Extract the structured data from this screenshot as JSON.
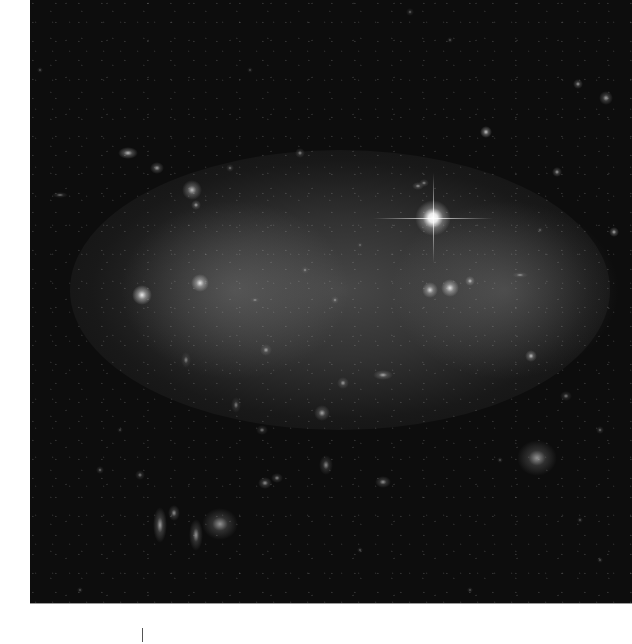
{
  "image": {
    "subject": "galaxy-cluster-deep-field",
    "background_color": "#0d0d0d",
    "border_color": "#ffffff"
  },
  "bright_star": {
    "x": 433,
    "y": 218,
    "size": 12,
    "spike_length_h": 120,
    "spike_length_v": 90
  },
  "objects": [
    {
      "x": 142,
      "y": 295,
      "w": 10,
      "h": 10,
      "b": 0.9
    },
    {
      "x": 200,
      "y": 283,
      "w": 9,
      "h": 9,
      "b": 0.85
    },
    {
      "x": 430,
      "y": 290,
      "w": 8,
      "h": 8,
      "b": 0.8
    },
    {
      "x": 450,
      "y": 288,
      "w": 9,
      "h": 9,
      "b": 0.85
    },
    {
      "x": 470,
      "y": 281,
      "w": 5,
      "h": 5,
      "b": 0.7
    },
    {
      "x": 192,
      "y": 190,
      "w": 10,
      "h": 10,
      "b": 0.7
    },
    {
      "x": 128,
      "y": 153,
      "w": 10,
      "h": 6,
      "b": 0.7
    },
    {
      "x": 157,
      "y": 168,
      "w": 7,
      "h": 6,
      "b": 0.6
    },
    {
      "x": 196,
      "y": 205,
      "w": 5,
      "h": 5,
      "b": 0.6
    },
    {
      "x": 537,
      "y": 458,
      "w": 20,
      "h": 18,
      "b": 0.55
    },
    {
      "x": 220,
      "y": 524,
      "w": 18,
      "h": 16,
      "b": 0.55
    },
    {
      "x": 160,
      "y": 525,
      "w": 7,
      "h": 18,
      "b": 0.6
    },
    {
      "x": 196,
      "y": 535,
      "w": 7,
      "h": 16,
      "b": 0.55
    },
    {
      "x": 174,
      "y": 513,
      "w": 6,
      "h": 8,
      "b": 0.55
    },
    {
      "x": 265,
      "y": 483,
      "w": 7,
      "h": 6,
      "b": 0.55
    },
    {
      "x": 277,
      "y": 478,
      "w": 6,
      "h": 5,
      "b": 0.5
    },
    {
      "x": 383,
      "y": 482,
      "w": 8,
      "h": 6,
      "b": 0.55
    },
    {
      "x": 326,
      "y": 465,
      "w": 7,
      "h": 10,
      "b": 0.5
    },
    {
      "x": 322,
      "y": 413,
      "w": 8,
      "h": 8,
      "b": 0.6
    },
    {
      "x": 383,
      "y": 375,
      "w": 10,
      "h": 5,
      "b": 0.6
    },
    {
      "x": 266,
      "y": 350,
      "w": 6,
      "h": 6,
      "b": 0.55
    },
    {
      "x": 343,
      "y": 383,
      "w": 6,
      "h": 6,
      "b": 0.55
    },
    {
      "x": 531,
      "y": 356,
      "w": 6,
      "h": 6,
      "b": 0.7
    },
    {
      "x": 486,
      "y": 132,
      "w": 6,
      "h": 6,
      "b": 0.75
    },
    {
      "x": 557,
      "y": 172,
      "w": 5,
      "h": 5,
      "b": 0.6
    },
    {
      "x": 606,
      "y": 98,
      "w": 7,
      "h": 7,
      "b": 0.6
    },
    {
      "x": 578,
      "y": 84,
      "w": 5,
      "h": 5,
      "b": 0.6
    },
    {
      "x": 614,
      "y": 232,
      "w": 5,
      "h": 5,
      "b": 0.65
    },
    {
      "x": 418,
      "y": 186,
      "w": 6,
      "h": 4,
      "b": 0.55
    },
    {
      "x": 424,
      "y": 183,
      "w": 5,
      "h": 4,
      "b": 0.5
    },
    {
      "x": 520,
      "y": 275,
      "w": 8,
      "h": 3,
      "b": 0.5
    },
    {
      "x": 262,
      "y": 430,
      "w": 6,
      "h": 5,
      "b": 0.45
    },
    {
      "x": 236,
      "y": 405,
      "w": 5,
      "h": 8,
      "b": 0.45
    },
    {
      "x": 186,
      "y": 360,
      "w": 5,
      "h": 8,
      "b": 0.45
    },
    {
      "x": 300,
      "y": 153,
      "w": 5,
      "h": 5,
      "b": 0.5
    },
    {
      "x": 230,
      "y": 168,
      "w": 4,
      "h": 4,
      "b": 0.45
    },
    {
      "x": 100,
      "y": 470,
      "w": 4,
      "h": 4,
      "b": 0.45
    },
    {
      "x": 140,
      "y": 475,
      "w": 5,
      "h": 5,
      "b": 0.45
    },
    {
      "x": 410,
      "y": 12,
      "w": 4,
      "h": 4,
      "b": 0.4
    },
    {
      "x": 450,
      "y": 40,
      "w": 3,
      "h": 3,
      "b": 0.4
    },
    {
      "x": 250,
      "y": 70,
      "w": 3,
      "h": 3,
      "b": 0.35
    },
    {
      "x": 60,
      "y": 195,
      "w": 8,
      "h": 3,
      "b": 0.45
    },
    {
      "x": 566,
      "y": 396,
      "w": 6,
      "h": 5,
      "b": 0.45
    },
    {
      "x": 600,
      "y": 560,
      "w": 3,
      "h": 3,
      "b": 0.4
    },
    {
      "x": 500,
      "y": 460,
      "w": 3,
      "h": 3,
      "b": 0.4
    },
    {
      "x": 360,
      "y": 550,
      "w": 3,
      "h": 3,
      "b": 0.4
    },
    {
      "x": 80,
      "y": 590,
      "w": 3,
      "h": 3,
      "b": 0.4
    },
    {
      "x": 470,
      "y": 590,
      "w": 3,
      "h": 3,
      "b": 0.4
    },
    {
      "x": 335,
      "y": 300,
      "w": 4,
      "h": 4,
      "b": 0.5
    },
    {
      "x": 305,
      "y": 270,
      "w": 4,
      "h": 4,
      "b": 0.45
    },
    {
      "x": 255,
      "y": 300,
      "w": 5,
      "h": 3,
      "b": 0.45
    },
    {
      "x": 360,
      "y": 245,
      "w": 3,
      "h": 3,
      "b": 0.4
    },
    {
      "x": 580,
      "y": 520,
      "w": 3,
      "h": 3,
      "b": 0.4
    },
    {
      "x": 40,
      "y": 70,
      "w": 3,
      "h": 3,
      "b": 0.4
    },
    {
      "x": 120,
      "y": 430,
      "w": 3,
      "h": 3,
      "b": 0.35
    },
    {
      "x": 540,
      "y": 230,
      "w": 3,
      "h": 3,
      "b": 0.4
    },
    {
      "x": 600,
      "y": 430,
      "w": 4,
      "h": 4,
      "b": 0.45
    }
  ],
  "footer": {
    "tick_mark_x": 142
  }
}
